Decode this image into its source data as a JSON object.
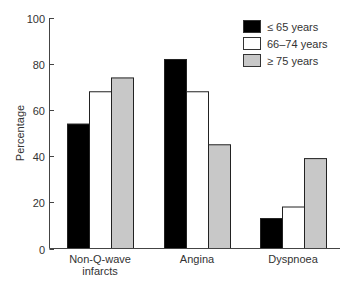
{
  "chart_data": {
    "type": "bar",
    "title": "",
    "xlabel": "",
    "ylabel": "Percentage",
    "ylim": [
      0,
      100
    ],
    "yticks": [
      0,
      20,
      40,
      60,
      80,
      100
    ],
    "grid": false,
    "legend_position": "top-right",
    "categories": [
      "Non-Q-wave infarcts",
      "Angina",
      "Dyspnoea"
    ],
    "category_lines": [
      [
        "Non-Q-wave",
        "infarcts"
      ],
      [
        "Angina"
      ],
      [
        "Dyspnoea"
      ]
    ],
    "series": [
      {
        "name": "≤ 65 years",
        "color": "#000000",
        "values": [
          54,
          82,
          13
        ]
      },
      {
        "name": "66–74 years",
        "color": "#ffffff",
        "values": [
          68,
          68,
          18
        ]
      },
      {
        "name": "≥ 75 years",
        "color": "#c8c8c8",
        "values": [
          74,
          45,
          39
        ]
      }
    ]
  }
}
